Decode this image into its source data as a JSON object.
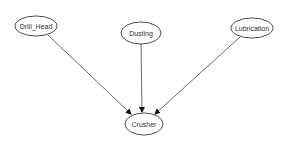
{
  "diagram": {
    "type": "directed-graph",
    "colors": {
      "background": "#ffffff",
      "node_stroke": "#222222",
      "node_fill": "#ffffff",
      "edge": "#444444",
      "text": "#333333"
    },
    "nodes": [
      {
        "id": "drill_head",
        "label": "Drill_Head",
        "cx": 36,
        "cy": 26,
        "rx": 21,
        "ry": 10
      },
      {
        "id": "dusting",
        "label": "Dusting",
        "cx": 141,
        "cy": 33,
        "rx": 20,
        "ry": 11
      },
      {
        "id": "lubrication",
        "label": "Lubrication",
        "cx": 252,
        "cy": 28,
        "rx": 21,
        "ry": 10
      },
      {
        "id": "crusher",
        "label": "Crusher",
        "cx": 144,
        "cy": 124,
        "rx": 19,
        "ry": 11
      }
    ],
    "edges": [
      {
        "from": "drill_head",
        "to": "crusher",
        "x1": 48,
        "y1": 35,
        "x2": 131,
        "y2": 114
      },
      {
        "from": "dusting",
        "to": "crusher",
        "x1": 141,
        "y1": 44,
        "x2": 142,
        "y2": 112
      },
      {
        "from": "lubrication",
        "to": "crusher",
        "x1": 240,
        "y1": 37,
        "x2": 155,
        "y2": 114
      }
    ]
  }
}
